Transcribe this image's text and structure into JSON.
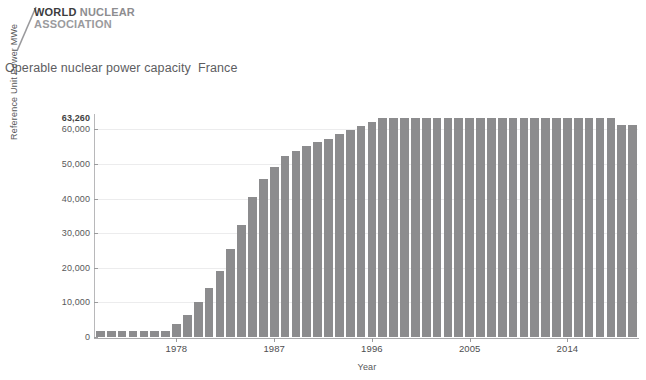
{
  "logo": {
    "line1_part1": "WORLD",
    "line1_part2": "NUCLEAR",
    "line2": "ASSOCIATION",
    "slash_icon": "slash-mark-icon"
  },
  "title": "Operable nuclear power capacity  France",
  "chart_data": {
    "type": "bar",
    "title": "Operable nuclear power capacity  France",
    "xlabel": "Year",
    "ylabel": "Reference Unit Power MWe",
    "ylim": [
      0,
      63260
    ],
    "xlim": [
      1971,
      2020
    ],
    "grid": true,
    "legend": "none",
    "bar_color": "#8c8c8e",
    "peak_annotation": "63,260",
    "peak_value": 63260,
    "y_ticks": [
      0,
      10000,
      20000,
      30000,
      40000,
      50000,
      60000
    ],
    "y_tick_labels": [
      "0",
      "10,000",
      "20,000",
      "30,000",
      "40,000",
      "50,000",
      "60,000"
    ],
    "x_ticks": [
      1978,
      1987,
      1996,
      2005,
      2014
    ],
    "x_tick_labels": [
      "1978",
      "1987",
      "1996",
      "2005",
      "2014"
    ],
    "categories": [
      1971,
      1972,
      1973,
      1974,
      1975,
      1976,
      1977,
      1978,
      1979,
      1980,
      1981,
      1982,
      1983,
      1984,
      1985,
      1986,
      1987,
      1988,
      1989,
      1990,
      1991,
      1992,
      1993,
      1994,
      1995,
      1996,
      1997,
      1998,
      1999,
      2000,
      2001,
      2002,
      2003,
      2004,
      2005,
      2006,
      2007,
      2008,
      2009,
      2010,
      2011,
      2012,
      2013,
      2014,
      2015,
      2016,
      2017,
      2018,
      2019,
      2020
    ],
    "values": [
      1750,
      1750,
      1750,
      1750,
      1750,
      1750,
      1850,
      3900,
      6500,
      10200,
      14300,
      19100,
      25400,
      32300,
      40500,
      45600,
      49200,
      52400,
      53800,
      55200,
      56300,
      57300,
      58500,
      59800,
      61000,
      62200,
      63260,
      63260,
      63260,
      63260,
      63260,
      63260,
      63260,
      63260,
      63260,
      63260,
      63260,
      63260,
      63260,
      63260,
      63260,
      63260,
      63260,
      63260,
      63260,
      63260,
      63260,
      63260,
      61370,
      61370
    ]
  }
}
